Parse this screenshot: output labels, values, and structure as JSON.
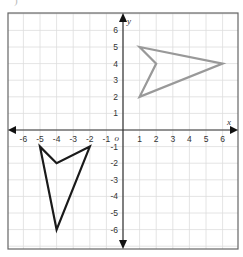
{
  "fragment_label": ")",
  "diagram": {
    "type": "coordinate-plane",
    "x_axis_label": "x",
    "y_axis_label": "y",
    "origin_label": "o",
    "x_ticks": [
      "-6",
      "-5",
      "-4",
      "-3",
      "-2",
      "-1",
      "1",
      "2",
      "3",
      "4",
      "5",
      "6"
    ],
    "x_tick_values": [
      -6,
      -5,
      -4,
      -3,
      -2,
      -1,
      1,
      2,
      3,
      4,
      5,
      6
    ],
    "y_ticks": [
      "6",
      "5",
      "4",
      "3",
      "2",
      "1",
      "-1",
      "-2",
      "-3",
      "-4",
      "-5",
      "-6"
    ],
    "y_tick_values": [
      6,
      5,
      4,
      3,
      2,
      1,
      -1,
      -2,
      -3,
      -4,
      -5,
      -6
    ],
    "range": {
      "xmin": -7,
      "xmax": 7,
      "ymin": -7,
      "ymax": 7
    },
    "grid": true,
    "colors": {
      "grid": "#dddddd",
      "axis": "#333333",
      "border": "#666666",
      "shape_gray": "#999999",
      "shape_black": "#1a1a1a"
    },
    "shapes": [
      {
        "name": "gray-figure",
        "color": "#999999",
        "vertices": [
          [
            1,
            5
          ],
          [
            6,
            4
          ],
          [
            1,
            2
          ],
          [
            2,
            4
          ]
        ]
      },
      {
        "name": "black-figure",
        "color": "#1a1a1a",
        "vertices": [
          [
            -5,
            -1
          ],
          [
            -4,
            -2
          ],
          [
            -2,
            -1
          ],
          [
            -4,
            -6
          ]
        ]
      }
    ]
  }
}
